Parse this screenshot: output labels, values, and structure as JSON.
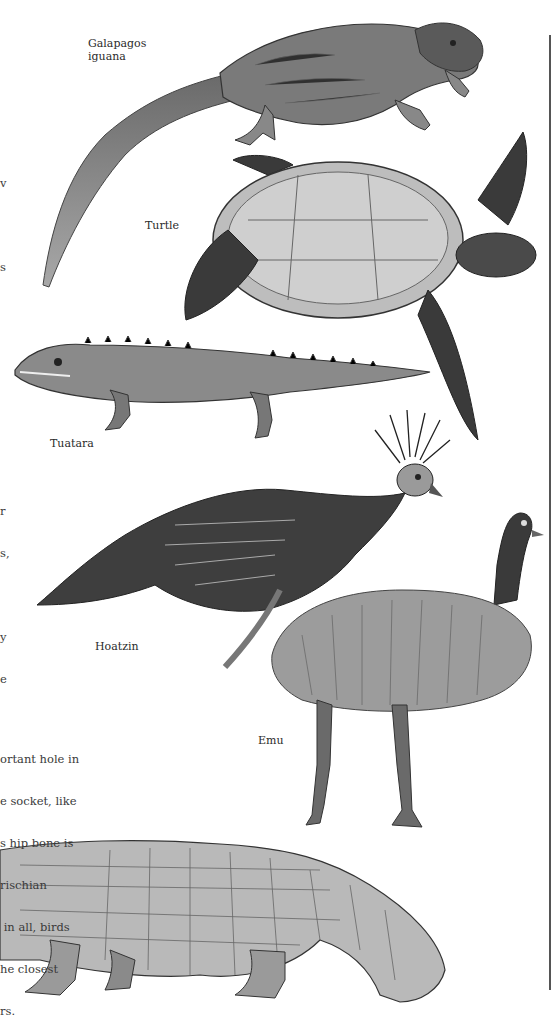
{
  "page": {
    "kind": "illustrated book page",
    "theme": "living relatives of dinosaurs"
  },
  "labels": {
    "iguana": "Galapagos",
    "iguana_line2": "iguana",
    "turtle": "Turtle",
    "tuatara": "Tuatara",
    "hoatzin": "Hoatzin",
    "emu": "Emu"
  },
  "text_fragments": {
    "top_margin": [
      "v",
      "",
      "s"
    ],
    "middle_margin": [
      "r",
      "s,",
      "",
      "y",
      "e"
    ],
    "body_paragraph": [
      "ortant hole in",
      "e socket, like",
      "s hip bone is",
      "rischian",
      " in all, birds",
      "he closest",
      "rs."
    ]
  },
  "illustrations": [
    {
      "id": "galapagos-iguana",
      "caption": "Galapagos iguana"
    },
    {
      "id": "turtle",
      "caption": "Turtle"
    },
    {
      "id": "tuatara",
      "caption": "Tuatara"
    },
    {
      "id": "hoatzin",
      "caption": "Hoatzin"
    },
    {
      "id": "emu",
      "caption": "Emu"
    },
    {
      "id": "crocodile",
      "caption": ""
    }
  ],
  "colors": {
    "ink": "#2b2b2b",
    "shade_dark": "#4a4a4a",
    "shade_mid": "#8a8a8a",
    "shade_light": "#c8c8c8",
    "paper": "#ffffff"
  }
}
